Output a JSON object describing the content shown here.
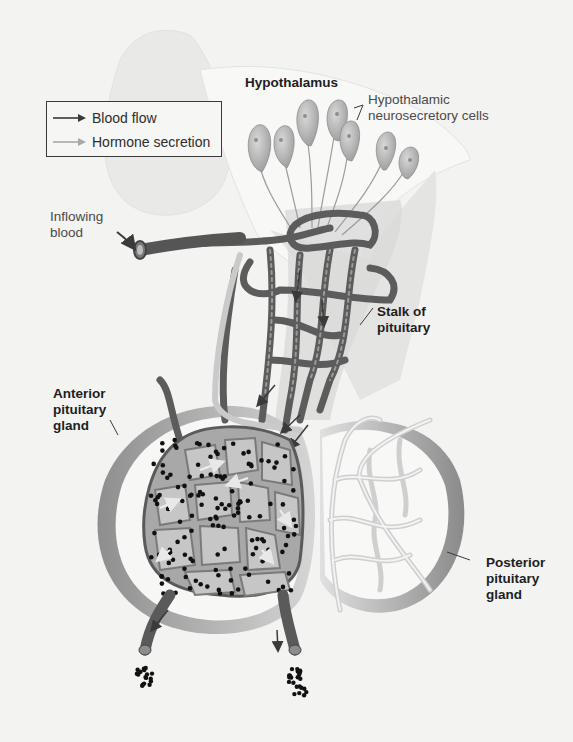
{
  "figure": {
    "palette": {
      "background": "#f3f3f1",
      "vessel_dark": "#6a6a6a",
      "vessel_light": "#cfcfcf",
      "cell_fill": "#b9b9b9",
      "gland_shadow": "#9a9a9a",
      "hormone_dot": "#111111"
    }
  },
  "legend": {
    "items": [
      {
        "label": "Blood flow",
        "arrow_color": "#3a3a3a"
      },
      {
        "label": "Hormone secretion",
        "arrow_color": "#a9a9a9"
      }
    ]
  },
  "labels": {
    "hypothalamus": "Hypothalamus",
    "neurosecretory_cells": "Hypothalamic\nneurosecretory cells",
    "inflowing_blood": "Inflowing\nblood",
    "stalk": "Stalk of\npituitary",
    "anterior": "Anterior\npituitary\ngland",
    "posterior": "Posterior\npituitary\ngland"
  }
}
